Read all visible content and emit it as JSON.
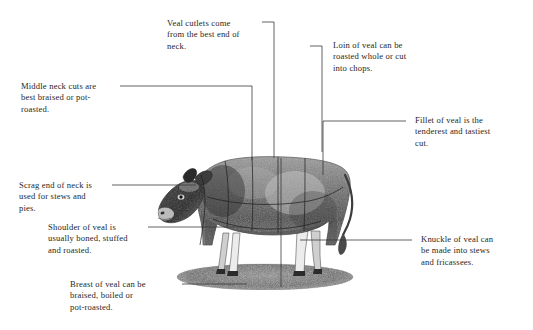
{
  "figure": {
    "background_color": "#ffffff",
    "ink_color": "#262626",
    "line_color": "#3a3a3a"
  },
  "callouts": [
    {
      "id": "veal-cutlets",
      "text": "Veal cutlets come\nfrom the best end of\nneck.",
      "x": 167,
      "y": 18,
      "align": "left"
    },
    {
      "id": "loin",
      "text": "Loin of veal can be\nroasted whole or cut\ninto chops.",
      "x": 333,
      "y": 40,
      "align": "left"
    },
    {
      "id": "middle-neck",
      "text": "Middle neck cuts are\nbest braised or pot-\nroasted.",
      "x": 21,
      "y": 81,
      "align": "left"
    },
    {
      "id": "fillet",
      "text": "Fillet of veal is the\ntenderest and tastiest\ncut.",
      "x": 415,
      "y": 115,
      "align": "left"
    },
    {
      "id": "scrag-end",
      "text": "Scrag end of neck is\nused for stews and\npies.",
      "x": 19,
      "y": 180,
      "align": "left"
    },
    {
      "id": "shoulder",
      "text": "Shoulder of veal is\nusually boned, stuffed\nand roasted.",
      "x": 48,
      "y": 222,
      "align": "left"
    },
    {
      "id": "knuckle",
      "text": "Knuckle of veal can\nbe made into stews\nand fricassees.",
      "x": 421,
      "y": 234,
      "align": "left"
    },
    {
      "id": "breast",
      "text": "Breast of veal can be\nbraised, boiled or\npot-roasted.",
      "x": 70,
      "y": 279,
      "align": "left"
    }
  ],
  "leader_lines": [
    {
      "id": "leader-veal-cutlets",
      "points": "262,22 274,22 274,158"
    },
    {
      "id": "leader-loin",
      "points": "310,46 322,46 322,152"
    },
    {
      "id": "leader-middle-neck",
      "points": "120,86 252,86 252,160"
    },
    {
      "id": "leader-fillet",
      "points": "406,121 323,121 323,175"
    },
    {
      "id": "leader-scrag-end",
      "points": "112,185 196,185"
    },
    {
      "id": "leader-shoulder",
      "points": "148,227 243,227"
    },
    {
      "id": "leader-knuckle",
      "points": "412,240 300,240"
    },
    {
      "id": "leader-breast",
      "points": "182,284 247,284"
    },
    {
      "id": "leader-breast-drop",
      "points": "281,158 281,287"
    }
  ],
  "illustration": {
    "name": "calf-engraving",
    "description": "Side view engraving of a standing calf on an oval ground shadow, overlaid with butcher cut division lines.",
    "ground_shadow": true,
    "cut_division_lines": 6
  }
}
